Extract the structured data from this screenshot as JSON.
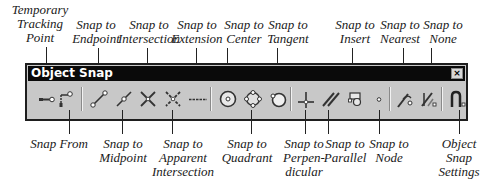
{
  "toolbar": {
    "title": "Object Snap",
    "close_label": "×",
    "colors": {
      "titlebar": "#0a0a0a",
      "body": "#c8c8c8",
      "title_text": "#ffffff"
    }
  },
  "buttons": [
    {
      "id": "temporary-tracking-point",
      "icon": "tracking-point-icon"
    },
    {
      "id": "snap-from",
      "icon": "snap-from-icon"
    },
    {
      "id": "snap-to-endpoint",
      "icon": "endpoint-icon"
    },
    {
      "id": "snap-to-midpoint",
      "icon": "midpoint-icon"
    },
    {
      "id": "snap-to-intersection",
      "icon": "intersection-icon"
    },
    {
      "id": "snap-to-apparent-intersection",
      "icon": "apparent-intersection-icon"
    },
    {
      "id": "snap-to-extension",
      "icon": "extension-icon"
    },
    {
      "id": "snap-to-center",
      "icon": "center-icon"
    },
    {
      "id": "snap-to-quadrant",
      "icon": "quadrant-icon"
    },
    {
      "id": "snap-to-tangent",
      "icon": "tangent-icon"
    },
    {
      "id": "snap-to-perpendicular",
      "icon": "perpendicular-icon"
    },
    {
      "id": "snap-to-parallel",
      "icon": "parallel-icon"
    },
    {
      "id": "snap-to-insert",
      "icon": "insert-icon"
    },
    {
      "id": "snap-to-node",
      "icon": "node-icon"
    },
    {
      "id": "snap-to-nearest",
      "icon": "nearest-icon"
    },
    {
      "id": "snap-to-none",
      "icon": "none-icon"
    },
    {
      "id": "object-snap-settings",
      "icon": "osnap-settings-icon"
    }
  ],
  "callouts_top": {
    "temporary_tracking_point": [
      "Temporary",
      "Tracking",
      "Point"
    ],
    "endpoint": [
      "Snap to",
      "Endpoint"
    ],
    "intersection": [
      "Snap to",
      "Intersection"
    ],
    "extension": [
      "Snap to",
      "Extension"
    ],
    "center": [
      "Snap to",
      "Center"
    ],
    "tangent": [
      "Snap to",
      "Tangent"
    ],
    "insert": [
      "Snap to",
      "Insert"
    ],
    "nearest": [
      "Snap to",
      "Nearest"
    ],
    "none": [
      "Snap to",
      "None"
    ]
  },
  "callouts_bottom": {
    "snap_from": [
      "Snap From"
    ],
    "midpoint": [
      "Snap to",
      "Midpoint"
    ],
    "apparent_intersection": [
      "Snap to",
      "Apparent",
      "Intersection"
    ],
    "quadrant": [
      "Snap to",
      "Quadrant"
    ],
    "perpendicular": [
      "Snap to",
      "Perpen-",
      "dicular"
    ],
    "parallel": [
      "Snap to",
      "Parallel"
    ],
    "node": [
      "Snap to",
      "Node"
    ],
    "settings": [
      "Object",
      "Snap",
      "Settings"
    ]
  }
}
